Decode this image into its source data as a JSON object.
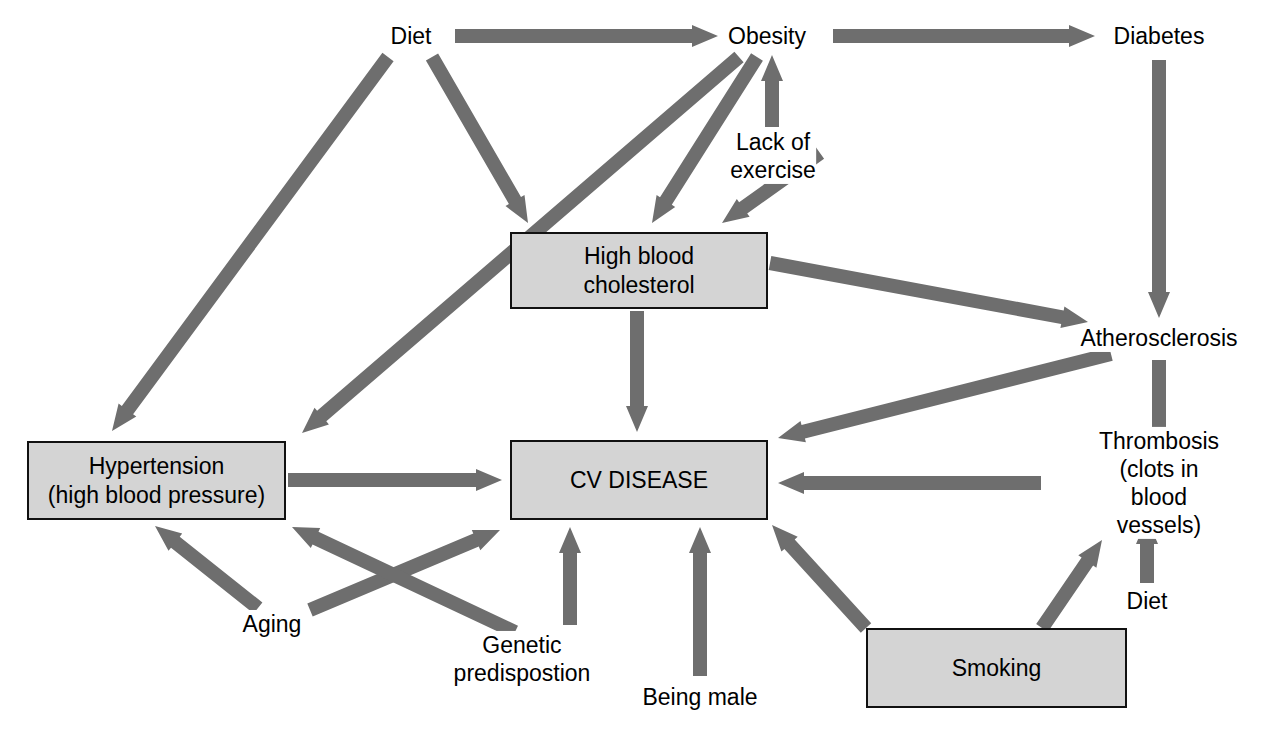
{
  "diagram": {
    "background_color": "#ffffff",
    "arrow_color": "#6e6e6e",
    "box_fill_color": "#d4d4d4",
    "box_border_color": "#111111",
    "text_color": "#000000",
    "nodes": [
      {
        "id": "diet_top",
        "label": "Diet",
        "shape": "plain",
        "x": 411,
        "y": 36
      },
      {
        "id": "obesity",
        "label": "Obesity",
        "shape": "plain",
        "x": 767,
        "y": 36
      },
      {
        "id": "diabetes",
        "label": "Diabetes",
        "shape": "plain",
        "x": 1159,
        "y": 36
      },
      {
        "id": "lack_exercise",
        "label": "Lack of\nexercise",
        "shape": "plain",
        "x": 773,
        "y": 156
      },
      {
        "id": "cholesterol",
        "label": "High blood\ncholesterol",
        "shape": "box",
        "x": 637,
        "y": 270
      },
      {
        "id": "atherosclerosis",
        "label": "Atherosclerosis",
        "shape": "plain",
        "x": 1159,
        "y": 338
      },
      {
        "id": "hypertension",
        "label": "Hypertension\n(high blood pressure)",
        "shape": "box",
        "x": 156,
        "y": 480
      },
      {
        "id": "cv_disease",
        "label": "CV DISEASE",
        "shape": "box",
        "x": 637,
        "y": 480
      },
      {
        "id": "thrombosis",
        "label": "Thrombosis\n(clots in blood vessels)",
        "shape": "plain",
        "x": 1159,
        "y": 483
      },
      {
        "id": "aging",
        "label": "Aging",
        "shape": "plain",
        "x": 272,
        "y": 624
      },
      {
        "id": "genetic",
        "label": "Genetic\npredispostion",
        "shape": "plain",
        "x": 522,
        "y": 659
      },
      {
        "id": "being_male",
        "label": "Being male",
        "shape": "plain",
        "x": 700,
        "y": 697
      },
      {
        "id": "diet_bottom",
        "label": "Diet",
        "shape": "plain",
        "x": 1147,
        "y": 601
      },
      {
        "id": "smoking",
        "label": "Smoking",
        "shape": "box",
        "x": 996,
        "y": 668
      }
    ],
    "boxes": [
      {
        "id": "cholesterol",
        "x": 510,
        "y": 232,
        "width": 258,
        "height": 77
      },
      {
        "id": "hypertension",
        "x": 27,
        "y": 441,
        "width": 259,
        "height": 79
      },
      {
        "id": "cv_disease",
        "x": 510,
        "y": 440,
        "width": 258,
        "height": 80
      },
      {
        "id": "smoking",
        "x": 866,
        "y": 628,
        "width": 261,
        "height": 80
      }
    ],
    "edges": [
      {
        "from": "diet_top",
        "to": "obesity",
        "x1": 455,
        "y1": 36,
        "x2": 718,
        "y2": 36
      },
      {
        "from": "obesity",
        "to": "diabetes",
        "x1": 833,
        "y1": 36,
        "x2": 1095,
        "y2": 36
      },
      {
        "from": "diet_top",
        "to": "hypertension",
        "x1": 388,
        "y1": 57,
        "x2": 112,
        "y2": 431
      },
      {
        "from": "diet_top",
        "to": "cholesterol",
        "x1": 432,
        "y1": 57,
        "x2": 528,
        "y2": 223
      },
      {
        "from": "obesity",
        "to": "hypertension",
        "x1": 739,
        "y1": 57,
        "x2": 302,
        "y2": 433
      },
      {
        "from": "obesity",
        "to": "cholesterol",
        "x1": 757,
        "y1": 57,
        "x2": 652,
        "y2": 223
      },
      {
        "from": "lack_exercise",
        "to": "obesity",
        "x1": 772,
        "y1": 127,
        "x2": 772,
        "y2": 55
      },
      {
        "from": "lack_exercise",
        "to": "cholesterol",
        "x1": 820,
        "y1": 153,
        "x2": 722,
        "y2": 223
      },
      {
        "from": "cholesterol",
        "to": "atherosclerosis",
        "x1": 770,
        "y1": 263,
        "x2": 1088,
        "y2": 322
      },
      {
        "from": "cholesterol",
        "to": "cv_disease",
        "x1": 637,
        "y1": 311,
        "x2": 637,
        "y2": 432
      },
      {
        "from": "diabetes",
        "to": "atherosclerosis",
        "x1": 1159,
        "y1": 60,
        "x2": 1159,
        "y2": 318
      },
      {
        "from": "atherosclerosis",
        "to": "cv_disease",
        "x1": 1111,
        "y1": 354,
        "x2": 778,
        "y2": 438
      },
      {
        "from": "atherosclerosis",
        "to": "thrombosis",
        "x1": 1159,
        "y1": 360,
        "x2": 1159,
        "y2": 453
      },
      {
        "from": "thrombosis",
        "to": "cv_disease",
        "x1": 1041,
        "y1": 483,
        "x2": 778,
        "y2": 483
      },
      {
        "from": "diet_bottom",
        "to": "thrombosis",
        "x1": 1147,
        "y1": 583,
        "x2": 1147,
        "y2": 518
      },
      {
        "from": "hypertension",
        "to": "cv_disease",
        "x1": 288,
        "y1": 480,
        "x2": 502,
        "y2": 480
      },
      {
        "from": "aging",
        "to": "hypertension",
        "x1": 258,
        "y1": 608,
        "x2": 155,
        "y2": 526
      },
      {
        "from": "aging",
        "to": "cv_disease",
        "x1": 310,
        "y1": 610,
        "x2": 500,
        "y2": 530
      },
      {
        "from": "genetic",
        "to": "hypertension",
        "x1": 515,
        "y1": 632,
        "x2": 292,
        "y2": 527
      },
      {
        "from": "genetic",
        "to": "cv_disease",
        "x1": 570,
        "y1": 625,
        "x2": 570,
        "y2": 527
      },
      {
        "from": "being_male",
        "to": "cv_disease",
        "x1": 700,
        "y1": 676,
        "x2": 700,
        "y2": 527
      },
      {
        "from": "smoking",
        "to": "cv_disease",
        "x1": 866,
        "y1": 628,
        "x2": 772,
        "y2": 525
      },
      {
        "from": "smoking",
        "to": "thrombosis",
        "x1": 1042,
        "y1": 628,
        "x2": 1102,
        "y2": 540
      }
    ]
  }
}
